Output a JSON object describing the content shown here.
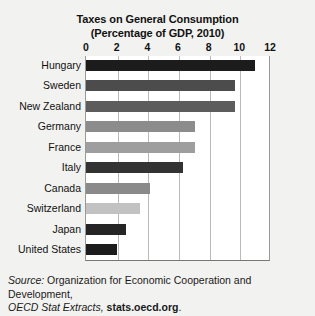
{
  "chart_data": {
    "type": "bar",
    "orientation": "horizontal",
    "title": "Taxes on General Consumption",
    "subtitle": "(Percentage of GDP, 2010)",
    "xlabel": "",
    "ylabel": "",
    "xlim": [
      0,
      12
    ],
    "grid": true,
    "legend": "none",
    "tick_labels": [
      "0",
      "2",
      "4",
      "6",
      "8",
      "10",
      "12"
    ],
    "ticks": [
      0,
      2,
      4,
      6,
      8,
      10,
      12
    ],
    "categories": [
      "Hungary",
      "Sweden",
      "New Zealand",
      "Germany",
      "France",
      "Italy",
      "Canada",
      "Switzerland",
      "Japan",
      "United States"
    ],
    "values": [
      11.0,
      9.7,
      9.7,
      7.1,
      7.1,
      6.3,
      4.2,
      3.5,
      2.6,
      2.0
    ],
    "bar_colors": [
      "#1c1c1c",
      "#4c4c4c",
      "#5c5c5c",
      "#8c8c8c",
      "#9e9e9e",
      "#333333",
      "#8a8a8a",
      "#c2c2c2",
      "#252525",
      "#1c1c1c"
    ]
  },
  "source": {
    "label": "Source:",
    "text": " Organization for Economic Cooperation and Development,",
    "line2_italic": "OECD Stat Extracts,",
    "line2_bold": " stats.oecd.org",
    "line2_end": "."
  },
  "colors": {
    "page_background": "#f2f2f0",
    "plot_background": "#ffffff",
    "gridline": "#b9b9b7",
    "axis_line": "#777777",
    "text": "#1a1a1a"
  }
}
